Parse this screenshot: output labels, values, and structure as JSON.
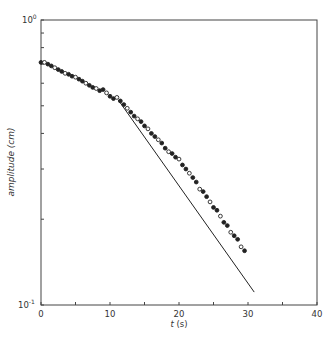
{
  "chart_data": {
    "type": "scatter",
    "title": "",
    "xlabel": "t (s)",
    "ylabel": "amplitude (cm)",
    "xlabel_var": "t",
    "xlabel_unit": "(s)",
    "xlim": [
      0,
      40
    ],
    "ylim": [
      0.1,
      1.0
    ],
    "yscale": "log",
    "grid": false,
    "legend": null,
    "x_ticks": [
      0,
      5,
      10,
      15,
      20,
      25,
      30,
      35,
      40
    ],
    "x_tick_labels": [
      "0",
      "",
      "10",
      "",
      "20",
      "",
      "30",
      "",
      "40"
    ],
    "y_ticks": [
      0.1,
      0.2,
      0.3,
      0.4,
      0.5,
      0.6,
      0.7,
      0.8,
      0.9,
      1.0
    ],
    "y_tick_labels": {
      "top": "10^0",
      "bottom": "10^-1"
    },
    "series": [
      {
        "name": "measured amplitude",
        "marker": "circle",
        "x": [
          0,
          0.5,
          1.0,
          1.5,
          2.0,
          2.5,
          3.0,
          3.5,
          4.0,
          4.5,
          5.0,
          5.5,
          6.0,
          6.5,
          7.0,
          7.5,
          8.0,
          8.5,
          9.0,
          9.5,
          10.0,
          10.5,
          11.0,
          11.5,
          12.0,
          12.5,
          13.0,
          13.5,
          14.0,
          14.5,
          15.0,
          15.5,
          16.0,
          16.5,
          17.0,
          17.5,
          18.0,
          18.5,
          19.0,
          19.5,
          20.0,
          20.5,
          21.0,
          21.5,
          22.0,
          22.5,
          23.0,
          23.5,
          24.0,
          24.5,
          25.0,
          25.5,
          26.0,
          26.5,
          27.0,
          27.5,
          28.0,
          28.5,
          29.0,
          29.5
        ],
        "y": [
          0.71,
          0.71,
          0.7,
          0.69,
          0.68,
          0.67,
          0.66,
          0.65,
          0.645,
          0.635,
          0.63,
          0.62,
          0.61,
          0.6,
          0.59,
          0.58,
          0.575,
          0.565,
          0.57,
          0.555,
          0.54,
          0.53,
          0.535,
          0.52,
          0.505,
          0.49,
          0.475,
          0.46,
          0.45,
          0.44,
          0.425,
          0.415,
          0.4,
          0.39,
          0.38,
          0.37,
          0.355,
          0.345,
          0.34,
          0.33,
          0.325,
          0.31,
          0.3,
          0.29,
          0.28,
          0.27,
          0.255,
          0.25,
          0.24,
          0.23,
          0.22,
          0.215,
          0.205,
          0.195,
          0.19,
          0.18,
          0.175,
          0.17,
          0.16,
          0.155
        ]
      },
      {
        "name": "exponential fit",
        "marker": "line",
        "x": [
          11.2,
          30.9
        ],
        "y": [
          0.524,
          0.111
        ]
      }
    ]
  },
  "axes": {
    "x_tick_labels": [
      "0",
      "10",
      "20",
      "30",
      "40"
    ],
    "y_top_label_base": "10",
    "y_top_label_exp": "0",
    "y_bottom_label_base": "10",
    "y_bottom_label_exp": "-1",
    "xlabel_var": "t",
    "xlabel_unit": " (s)",
    "ylabel": "amplitude (cm)"
  }
}
